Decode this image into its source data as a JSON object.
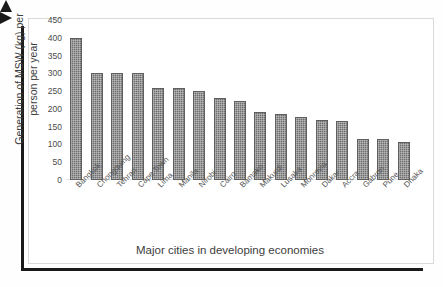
{
  "figure": {
    "background": "#ffffff",
    "frame_color": "#d9d9d9",
    "axis_arrow_color": "#1a1a1a",
    "bar_color": "#6e6e6e"
  },
  "axes": {
    "y_title_line1": "Generation of MSW (kg) per",
    "y_title_line2": "person per year",
    "x_title": "Major cities in developing economies"
  },
  "chart_data": {
    "type": "bar",
    "title": "",
    "xlabel": "Major cities in developing economies",
    "ylabel": "Generation of MSW (kg) per person per year",
    "ylim": [
      0,
      450
    ],
    "yticks": [
      0,
      50,
      100,
      150,
      200,
      250,
      300,
      350,
      400,
      450
    ],
    "ytick_labels": [
      "0",
      "50",
      "100",
      "150",
      "200",
      "250",
      "300",
      "350",
      "400",
      "450"
    ],
    "grid": false,
    "legend": false,
    "categories": [
      "Bangkok",
      "Chongquing",
      "Tehran",
      "Cape Town",
      "Lima",
      "Manila",
      "Nirobi",
      "Cairo",
      "Bamako",
      "Makurdi",
      "Lusaka",
      "Monrovia",
      "Dakar",
      "Accra",
      "Gabron",
      "Pune",
      "Dhaka"
    ],
    "values": [
      400,
      300,
      300,
      300,
      260,
      260,
      250,
      232,
      222,
      190,
      185,
      176,
      170,
      167,
      115,
      115,
      107
    ]
  }
}
